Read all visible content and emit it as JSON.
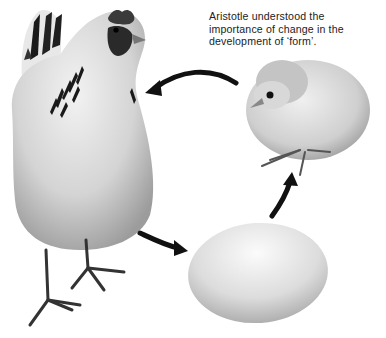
{
  "caption": {
    "lines": [
      "Aristotle understood the",
      "importance of change in the",
      "development of ‘form’."
    ]
  },
  "figure": {
    "subjects": [
      "hen",
      "chick",
      "egg"
    ],
    "arrows": [
      {
        "from": "chick",
        "to": "hen"
      },
      {
        "from": "hen",
        "to": "egg"
      },
      {
        "from": "egg",
        "to": "chick"
      }
    ],
    "colors": {
      "background": "#ffffff",
      "ink": "#111111",
      "feather_light": "#e6e6e6",
      "feather_mid": "#bdbdbd",
      "feather_dark": "#8a8a8a",
      "egg": "#d9d9d9"
    }
  }
}
